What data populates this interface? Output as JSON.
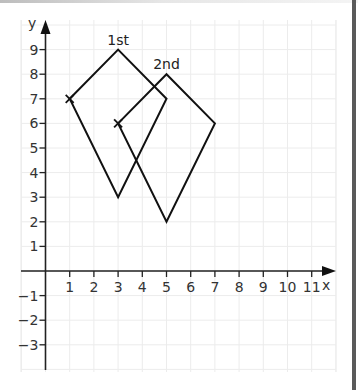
{
  "chart_data": {
    "type": "coordinate-grid",
    "title": "",
    "xlabel": "x",
    "ylabel": "y",
    "x_ticks": [
      1,
      2,
      3,
      4,
      5,
      6,
      7,
      8,
      9,
      10,
      11
    ],
    "y_ticks": [
      9,
      8,
      7,
      6,
      5,
      4,
      3,
      2,
      1,
      -1,
      -2,
      -3
    ],
    "x_tick_labels": [
      "1",
      "2",
      "3",
      "4",
      "5",
      "6",
      "7",
      "8",
      "9",
      "10",
      "11"
    ],
    "y_tick_labels": [
      "9",
      "8",
      "7",
      "6",
      "5",
      "4",
      "3",
      "2",
      "1",
      "−1",
      "−2",
      "−3"
    ],
    "xlim": [
      -1,
      12
    ],
    "ylim": [
      -4,
      10
    ],
    "grid": true,
    "shapes": [
      {
        "label": "1st",
        "vertices": [
          [
            1,
            7
          ],
          [
            3,
            9
          ],
          [
            5,
            7
          ],
          [
            3,
            3
          ]
        ],
        "marked_vertex": [
          1,
          7
        ],
        "label_position": [
          3,
          9
        ]
      },
      {
        "label": "2nd",
        "vertices": [
          [
            3,
            6
          ],
          [
            5,
            8
          ],
          [
            7,
            6
          ],
          [
            5,
            2
          ]
        ],
        "marked_vertex": [
          3,
          6
        ],
        "label_position": [
          5,
          8
        ]
      }
    ]
  },
  "axes": {
    "x_label": "x",
    "y_label": "y"
  },
  "labels": {
    "first": "1st",
    "second": "2nd"
  },
  "colors": {
    "line": "#111111",
    "grid": "#ececec",
    "border": "#5a5a5a"
  }
}
